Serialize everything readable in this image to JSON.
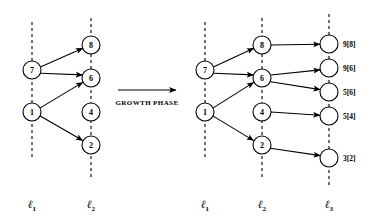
{
  "figure": {
    "kind": "two-panel-layered-graph",
    "background_color": "#ffffff",
    "ink_color": "#000000",
    "transition": {
      "label": "GROWTH PHASE",
      "arrow_name": "growth-phase-arrow"
    },
    "left_panel": {
      "name": "before-growth-panel",
      "levels": [
        {
          "id": "l1",
          "label": "ℓ",
          "subscript": "1",
          "x": 32
        },
        {
          "id": "l2",
          "label": "ℓ",
          "subscript": "2",
          "x": 91
        }
      ],
      "nodes": [
        {
          "id": "L-l1-7",
          "level": "l1",
          "value": "7",
          "cx": 32,
          "cy": 70,
          "r": 9
        },
        {
          "id": "L-l1-1",
          "level": "l1",
          "value": "1",
          "cx": 32,
          "cy": 112,
          "r": 9
        },
        {
          "id": "L-l2-8",
          "level": "l2",
          "value": "8",
          "cx": 91,
          "cy": 45,
          "r": 9
        },
        {
          "id": "L-l2-6",
          "level": "l2",
          "value": "6",
          "cx": 91,
          "cy": 78,
          "r": 9
        },
        {
          "id": "L-l2-4",
          "level": "l2",
          "value": "4",
          "cx": 91,
          "cy": 112,
          "r": 9
        },
        {
          "id": "L-l2-2",
          "level": "l2",
          "value": "2",
          "cx": 91,
          "cy": 145,
          "r": 9
        }
      ],
      "edges": [
        {
          "from": "L-l1-7",
          "to": "L-l2-8"
        },
        {
          "from": "L-l1-7",
          "to": "L-l2-6"
        },
        {
          "from": "L-l1-1",
          "to": "L-l2-6"
        },
        {
          "from": "L-l1-1",
          "to": "L-l2-2"
        }
      ]
    },
    "right_panel": {
      "name": "after-growth-panel",
      "levels": [
        {
          "id": "l1",
          "label": "ℓ",
          "subscript": "1",
          "x": 205
        },
        {
          "id": "l2",
          "label": "ℓ",
          "subscript": "2",
          "x": 262
        },
        {
          "id": "l3",
          "label": "ℓ",
          "subscript": "3",
          "x": 329
        }
      ],
      "nodes": [
        {
          "id": "R-l1-7",
          "level": "l1",
          "value": "7",
          "cx": 205,
          "cy": 70,
          "r": 9
        },
        {
          "id": "R-l1-1",
          "level": "l1",
          "value": "1",
          "cx": 205,
          "cy": 112,
          "r": 9
        },
        {
          "id": "R-l2-8",
          "level": "l2",
          "value": "8",
          "cx": 262,
          "cy": 45,
          "r": 9
        },
        {
          "id": "R-l2-6",
          "level": "l2",
          "value": "6",
          "cx": 262,
          "cy": 78,
          "r": 9
        },
        {
          "id": "R-l2-4",
          "level": "l2",
          "value": "4",
          "cx": 262,
          "cy": 112,
          "r": 9
        },
        {
          "id": "R-l2-2",
          "level": "l2",
          "value": "2",
          "cx": 262,
          "cy": 145,
          "r": 9
        },
        {
          "id": "R-l3-a",
          "level": "l3",
          "value": "",
          "cx": 329,
          "cy": 44,
          "r": 9,
          "tag": "9[8]"
        },
        {
          "id": "R-l3-b",
          "level": "l3",
          "value": "",
          "cx": 329,
          "cy": 68,
          "r": 9,
          "tag": "9[6]"
        },
        {
          "id": "R-l3-c",
          "level": "l3",
          "value": "",
          "cx": 329,
          "cy": 92,
          "r": 9,
          "tag": "5[6]"
        },
        {
          "id": "R-l3-d",
          "level": "l3",
          "value": "",
          "cx": 329,
          "cy": 116,
          "r": 9,
          "tag": "5[4]"
        },
        {
          "id": "R-l3-e",
          "level": "l3",
          "value": "",
          "cx": 329,
          "cy": 158,
          "r": 9,
          "tag": "3[2]"
        }
      ],
      "edges": [
        {
          "from": "R-l1-7",
          "to": "R-l2-8"
        },
        {
          "from": "R-l1-7",
          "to": "R-l2-6"
        },
        {
          "from": "R-l1-1",
          "to": "R-l2-6"
        },
        {
          "from": "R-l1-1",
          "to": "R-l2-2"
        },
        {
          "from": "R-l2-8",
          "to": "R-l3-a"
        },
        {
          "from": "R-l2-6",
          "to": "R-l3-b"
        },
        {
          "from": "R-l2-6",
          "to": "R-l3-c"
        },
        {
          "from": "R-l2-4",
          "to": "R-l3-d"
        },
        {
          "from": "R-l2-2",
          "to": "R-l3-e"
        }
      ],
      "tags": [
        {
          "for": "R-l3-a",
          "text": "9[8]"
        },
        {
          "for": "R-l3-b",
          "text": "9[6]"
        },
        {
          "for": "R-l3-c",
          "text": "5[6]"
        },
        {
          "for": "R-l3-d",
          "text": "5[4]"
        },
        {
          "for": "R-l3-e",
          "text": "3[2]"
        }
      ]
    }
  }
}
